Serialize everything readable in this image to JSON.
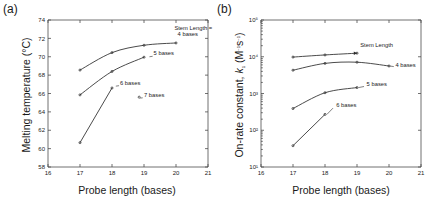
{
  "figure": {
    "panels": [
      {
        "id": "a",
        "label": "(a)",
        "xlabel": "Probe length (bases)",
        "ylabel": "Melting temperature (°C)"
      },
      {
        "id": "b",
        "label": "(b)",
        "xlabel": "Probe length (bases)",
        "ylabel_main": "On-rate constant, ",
        "ylabel_symbol": "k",
        "ylabel_sub": "1",
        "ylabel_units": " (M",
        "ylabel_units_sup1": "−1",
        "ylabel_units_mid": "s",
        "ylabel_units_sup2": "−1",
        "ylabel_units_end": ")"
      }
    ]
  },
  "chart_data": [
    {
      "type": "line",
      "panel": "a",
      "title": "(a)",
      "xlabel": "Probe length (bases)",
      "ylabel": "Melting temperature (°C)",
      "xlim": [
        16,
        21
      ],
      "ylim": [
        58,
        74
      ],
      "xticks": [
        16,
        17,
        18,
        19,
        20,
        21
      ],
      "yticks": [
        58,
        60,
        62,
        64,
        66,
        68,
        70,
        72,
        74
      ],
      "xtick_labels": [
        "16",
        "17",
        "18",
        "19",
        "20",
        "21"
      ],
      "ytick_labels": [
        "58",
        "60",
        "62",
        "64",
        "66",
        "68",
        "70",
        "72",
        "74"
      ],
      "yscale": "linear",
      "grid": false,
      "legend": "inline-annotations",
      "annotations": [
        {
          "text": "Stem Length =",
          "x": 19.95,
          "y": 72.9
        },
        {
          "text": "4 bases",
          "x": 20.05,
          "y": 72.25
        },
        {
          "text": "5 bases",
          "x": 19.3,
          "y": 70.15
        },
        {
          "text": "6 bases",
          "x": 18.25,
          "y": 66.9
        },
        {
          "text": "7 bases",
          "x": 19.0,
          "y": 65.6
        }
      ],
      "series": [
        {
          "name": "4 bases",
          "x": [
            17.0,
            18.0,
            19.0,
            20.0
          ],
          "y": [
            68.55,
            70.45,
            71.25,
            71.5
          ]
        },
        {
          "name": "5 bases",
          "x": [
            17.0,
            18.0,
            19.0
          ],
          "y": [
            65.85,
            68.4,
            69.95
          ]
        },
        {
          "name": "6 bases",
          "x": [
            17.0,
            18.0
          ],
          "y": [
            60.65,
            66.6
          ]
        },
        {
          "name": "7 bases",
          "x": [
            18.85
          ],
          "y": [
            65.6
          ]
        }
      ]
    },
    {
      "type": "line",
      "panel": "b",
      "title": "(b)",
      "xlabel": "Probe length (bases)",
      "ylabel": "On-rate constant, k1 (M−1s−1)",
      "xlim": [
        16,
        21
      ],
      "ylim": [
        10,
        100000
      ],
      "xticks": [
        16,
        17,
        18,
        19,
        20,
        21
      ],
      "yticks": [
        10,
        100,
        1000,
        10000,
        100000
      ],
      "xtick_labels": [
        "16",
        "17",
        "18",
        "19",
        "20",
        "21"
      ],
      "ytick_labels": [
        "10¹",
        "10²",
        "10³",
        "10⁴",
        "10⁵"
      ],
      "yscale": "log",
      "grid": false,
      "legend": "inline-annotations",
      "annotations": [
        {
          "text": "Stem Length",
          "x": 19.1,
          "y": 19000
        },
        {
          "text": "4 bases",
          "x": 20.2,
          "y": 5300
        },
        {
          "text": "5 bases",
          "x": 19.3,
          "y": 1600
        },
        {
          "text": "6 bases",
          "x": 18.35,
          "y": 420
        }
      ],
      "series": [
        {
          "name": "stem-length-arrow",
          "x": [
            17.0,
            18.0,
            19.0
          ],
          "y": [
            9800,
            11200,
            12500
          ]
        },
        {
          "name": "4 bases",
          "x": [
            17.0,
            18.0,
            19.0,
            20.0
          ],
          "y": [
            4300,
            6600,
            7100,
            5600
          ]
        },
        {
          "name": "5 bases",
          "x": [
            17.0,
            18.0,
            19.0
          ],
          "y": [
            390,
            1050,
            1450
          ]
        },
        {
          "name": "6 bases",
          "x": [
            17.0,
            18.0
          ],
          "y": [
            38,
            270
          ]
        }
      ]
    }
  ]
}
